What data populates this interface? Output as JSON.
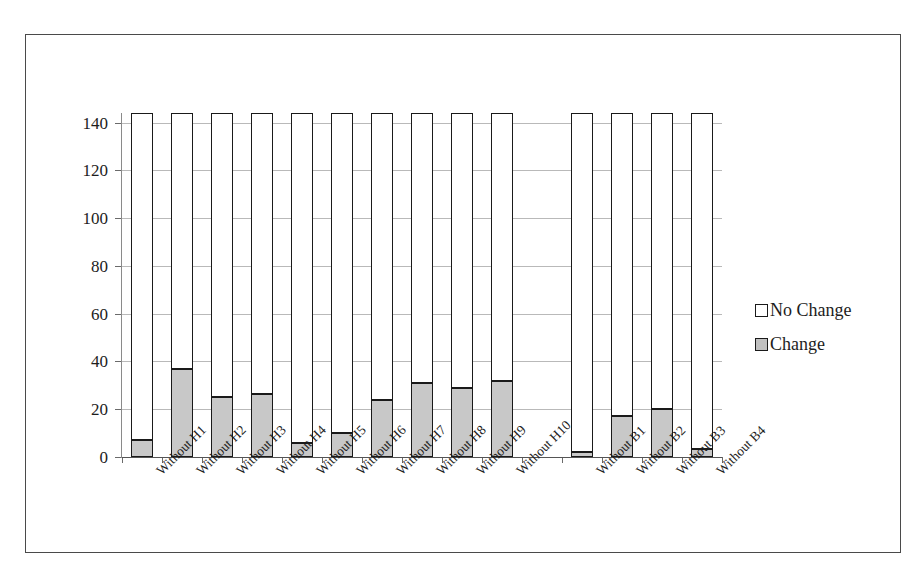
{
  "chart_data": {
    "type": "bar",
    "subtype": "stacked-bar",
    "title": "",
    "xlabel": "",
    "ylabel": "",
    "ylim": [
      0,
      144
    ],
    "yticks": [
      0,
      20,
      40,
      60,
      80,
      100,
      120,
      140
    ],
    "grid": true,
    "legend_position": "right",
    "total": 144,
    "categories": [
      "Without H1",
      "Without H2",
      "Without H3",
      "Without H4",
      "Without H5",
      "Without H6",
      "Without H7",
      "Without H8",
      "Without H9",
      "Without H10",
      "",
      "Without B1",
      "Without B2",
      "Without B3",
      "Without B4"
    ],
    "series": [
      {
        "name": "Change",
        "color": "#c8c8c8",
        "values": [
          7,
          37,
          25,
          26.5,
          6,
          10,
          24,
          31,
          29,
          32,
          null,
          2,
          17,
          20,
          3.5
        ]
      },
      {
        "name": "No Change",
        "color": "#ffffff",
        "values": [
          137,
          107,
          119,
          117.5,
          138,
          134,
          120,
          113,
          115,
          112,
          null,
          142,
          127,
          124,
          140.5
        ]
      }
    ],
    "legend": [
      {
        "label": "No Change",
        "swatch": "white-square"
      },
      {
        "label": "Change",
        "swatch": "gray-square"
      }
    ]
  },
  "colors": {
    "change": "#c8c8c8",
    "no_change": "#ffffff",
    "bar_outline": "#1a1a1a",
    "gridline": "#b9b9b9",
    "axis": "#555555",
    "frame": "#4a4a4a",
    "text": "#1d1d1d"
  }
}
